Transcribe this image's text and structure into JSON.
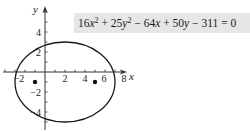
{
  "figure": {
    "equation": {
      "terms": [
        {
          "coef": "16",
          "var": "x",
          "exp": "2",
          "op": ""
        },
        {
          "coef": "25",
          "var": "y",
          "exp": "2",
          "op": " + "
        },
        {
          "coef": "64",
          "var": "x",
          "exp": "",
          "op": " − "
        },
        {
          "coef": "50",
          "var": "y",
          "exp": "",
          "op": " + "
        },
        {
          "coef": "311",
          "var": "",
          "exp": "",
          "op": " − "
        }
      ],
      "rhs": " = 0",
      "full_text": "16x² + 25y² − 64x + 50y − 311 = 0",
      "background": "#e6e6e6"
    },
    "axes": {
      "x_label": "x",
      "y_label": "y",
      "x_tick_labels": [
        "−2",
        "2",
        "4",
        "6",
        "8"
      ],
      "y_tick_labels": [
        "4",
        "2",
        "−2",
        "−4"
      ],
      "color": "#333333"
    },
    "ellipse": {
      "center": [
        2,
        -1
      ],
      "semi_major_x": 5,
      "semi_minor_y": 4,
      "color": "#1a1a1a"
    },
    "foci": [
      [
        -1,
        -1
      ],
      [
        5,
        -1
      ]
    ]
  }
}
